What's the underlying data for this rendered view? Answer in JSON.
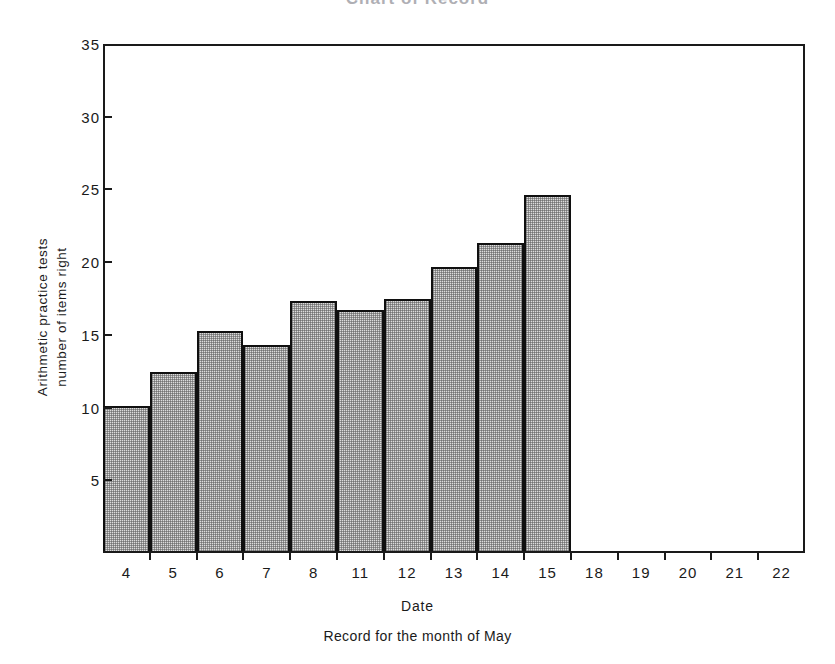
{
  "chart_data": {
    "type": "bar",
    "title": "Chart of Record",
    "xlabel": "Date",
    "ylabel": "Arithmetic practice tests\nnumber of items right",
    "caption": "Record for the month of May",
    "categories": [
      "4",
      "5",
      "6",
      "7",
      "8",
      "11",
      "12",
      "13",
      "14",
      "15",
      "18",
      "19",
      "20",
      "21",
      "22"
    ],
    "values": [
      10,
      12.3,
      15.1,
      14.2,
      17.2,
      16.6,
      17.3,
      19.5,
      21.2,
      24.5,
      null,
      null,
      null,
      null,
      null
    ],
    "ylim": [
      0,
      35
    ],
    "yticks": [
      5,
      10,
      15,
      20,
      25,
      30,
      35
    ],
    "xlim_categories": 15,
    "bars_drawn": 10,
    "grid": false,
    "legend": null,
    "bar_fill_color": "#dcdcdc",
    "bar_edge_color": "#101010",
    "axis_color": "#1a1a1a",
    "background_color": "#ffffff"
  }
}
